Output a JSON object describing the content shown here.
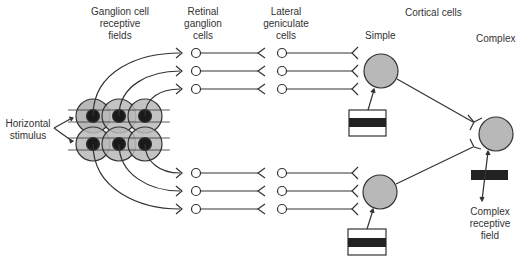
{
  "labels": {
    "ganglion_rf": [
      "Ganglion cell",
      "receptive",
      "fields"
    ],
    "retinal_ganglion": [
      "Retinal",
      "ganglion",
      "cells"
    ],
    "lateral_geniculate": [
      "Lateral",
      "geniculate",
      "cells"
    ],
    "cortical_cells": "Cortical cells",
    "simple": "Simple",
    "complex": "Complex",
    "horizontal_stimulus": [
      "Horizontal",
      "stimulus"
    ],
    "complex_rf": [
      "Complex",
      "receptive",
      "field"
    ]
  },
  "colors": {
    "cell_fill": "#b8b8b8",
    "center_fill": "#1a1a1a",
    "line": "#333333",
    "bar": "#222222"
  }
}
